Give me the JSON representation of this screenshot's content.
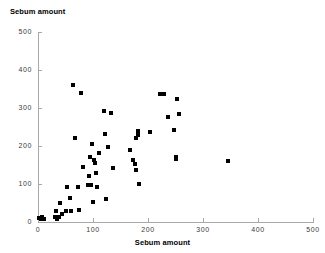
{
  "chart_data": {
    "type": "scatter",
    "title": "Sebum amount",
    "xlabel": "Sebum amount",
    "ylabel": "Sebum amount",
    "xlim": [
      0,
      500
    ],
    "ylim": [
      0,
      500
    ],
    "xticks": [
      0,
      100,
      200,
      300,
      400,
      500
    ],
    "yticks": [
      0,
      100,
      200,
      300,
      400,
      500
    ],
    "xtick_labels": [
      "0",
      "100",
      "200",
      "300",
      "400",
      "500"
    ],
    "ytick_labels": [
      "0",
      "100",
      "200",
      "300",
      "400",
      "500"
    ],
    "grid": false,
    "legend": null,
    "marker": "square",
    "marker_color": "#000000",
    "axis_color": "#a8a8a8",
    "points": [
      [
        2,
        10
      ],
      [
        5,
        8
      ],
      [
        7,
        12
      ],
      [
        9,
        7
      ],
      [
        11,
        9
      ],
      [
        30,
        12
      ],
      [
        33,
        28
      ],
      [
        35,
        9
      ],
      [
        36,
        14
      ],
      [
        38,
        13
      ],
      [
        40,
        50
      ],
      [
        44,
        22
      ],
      [
        50,
        30
      ],
      [
        53,
        92
      ],
      [
        58,
        62
      ],
      [
        60,
        28
      ],
      [
        63,
        360
      ],
      [
        67,
        220
      ],
      [
        72,
        93
      ],
      [
        75,
        32
      ],
      [
        78,
        340
      ],
      [
        82,
        145
      ],
      [
        90,
        98
      ],
      [
        92,
        122
      ],
      [
        95,
        172
      ],
      [
        97,
        97
      ],
      [
        98,
        205
      ],
      [
        100,
        53
      ],
      [
        102,
        163
      ],
      [
        104,
        155
      ],
      [
        106,
        128
      ],
      [
        108,
        93
      ],
      [
        110,
        182
      ],
      [
        120,
        292
      ],
      [
        122,
        232
      ],
      [
        124,
        60
      ],
      [
        128,
        198
      ],
      [
        132,
        287
      ],
      [
        136,
        143
      ],
      [
        168,
        190
      ],
      [
        172,
        163
      ],
      [
        176,
        152
      ],
      [
        178,
        138
      ],
      [
        179,
        222
      ],
      [
        181,
        228
      ],
      [
        182,
        240
      ],
      [
        183,
        101
      ],
      [
        204,
        238
      ],
      [
        222,
        336
      ],
      [
        226,
        336
      ],
      [
        229,
        336
      ],
      [
        237,
        277
      ],
      [
        248,
        243
      ],
      [
        250,
        170
      ],
      [
        251,
        165
      ],
      [
        252,
        323
      ],
      [
        257,
        284
      ],
      [
        346,
        161
      ]
    ]
  }
}
